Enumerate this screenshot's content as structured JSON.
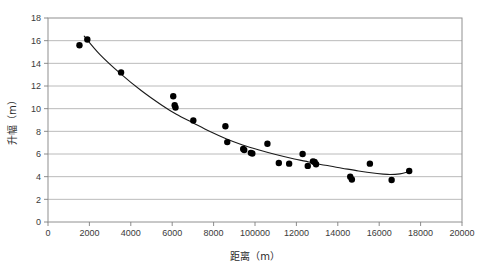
{
  "chart_data": {
    "type": "scatter",
    "title": "",
    "xlabel": "距离（m）",
    "ylabel": "升幅（m）",
    "xlim": [
      0,
      20000
    ],
    "ylim": [
      0,
      18
    ],
    "grid": "horizontal",
    "legend": "none",
    "x_ticks": [
      "0",
      "2000",
      "4000",
      "6000",
      "8000",
      "100000",
      "12000",
      "14000",
      "16000",
      "18000",
      "20000"
    ],
    "x_tick_values": [
      0,
      2000,
      4000,
      6000,
      8000,
      10000,
      12000,
      14000,
      16000,
      18000,
      20000
    ],
    "y_ticks": [
      "0",
      "2",
      "4",
      "6",
      "8",
      "10",
      "12",
      "14",
      "16",
      "18"
    ],
    "y_tick_values": [
      0,
      2,
      4,
      6,
      8,
      10,
      12,
      14,
      16,
      18
    ],
    "series": [
      {
        "name": "观测点",
        "type": "scatter",
        "marker": "filled-circle",
        "color": "#000000",
        "points": [
          [
            1520,
            15.6
          ],
          [
            1900,
            16.1
          ],
          [
            3530,
            13.2
          ],
          [
            6050,
            11.1
          ],
          [
            6120,
            10.3
          ],
          [
            6160,
            10.1
          ],
          [
            7020,
            8.95
          ],
          [
            8570,
            8.45
          ],
          [
            8660,
            7.05
          ],
          [
            9430,
            6.45
          ],
          [
            9480,
            6.35
          ],
          [
            9800,
            6.1
          ],
          [
            9870,
            6.05
          ],
          [
            10600,
            6.9
          ],
          [
            11150,
            5.2
          ],
          [
            11650,
            5.15
          ],
          [
            12300,
            6.0
          ],
          [
            12550,
            4.95
          ],
          [
            12800,
            5.35
          ],
          [
            12880,
            5.3
          ],
          [
            12950,
            5.1
          ],
          [
            14600,
            4.0
          ],
          [
            14680,
            3.75
          ],
          [
            15550,
            5.15
          ],
          [
            16600,
            3.7
          ],
          [
            17450,
            4.5
          ]
        ]
      },
      {
        "name": "趋势线",
        "type": "line",
        "color": "#1a1a1a",
        "points": [
          [
            1750,
            16.4
          ],
          [
            2500,
            14.8
          ],
          [
            3530,
            13.05
          ],
          [
            4500,
            11.6
          ],
          [
            5500,
            10.3
          ],
          [
            6200,
            9.5
          ],
          [
            7000,
            8.75
          ],
          [
            7800,
            8.0
          ],
          [
            8600,
            7.35
          ],
          [
            9400,
            6.8
          ],
          [
            10200,
            6.35
          ],
          [
            11000,
            5.95
          ],
          [
            11800,
            5.6
          ],
          [
            12600,
            5.3
          ],
          [
            13400,
            5.0
          ],
          [
            14200,
            4.75
          ],
          [
            15000,
            4.5
          ],
          [
            15800,
            4.3
          ],
          [
            16400,
            4.2
          ],
          [
            17000,
            4.25
          ],
          [
            17450,
            4.45
          ]
        ]
      }
    ]
  },
  "axes": {
    "x_axis_name": "x-axis",
    "y_axis_name": "y-axis"
  }
}
